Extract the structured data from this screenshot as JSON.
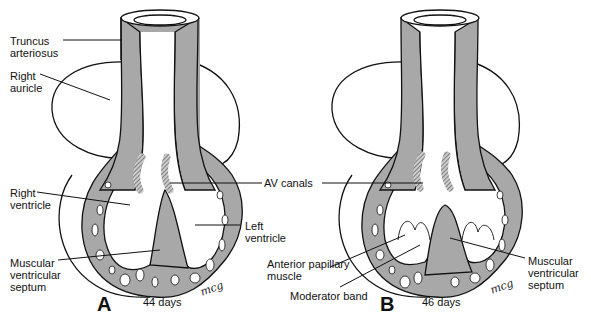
{
  "figure": {
    "panels": [
      {
        "letter": "A",
        "age": "44 days",
        "signature": "mcg",
        "labels": {
          "truncus": "Truncus\narteriosus",
          "right_auricle": "Right\nauricle",
          "right_ventricle": "Right\nventricle",
          "left_ventricle": "Left\nventricle",
          "muscular_septum": "Muscular\nventricular\nseptum"
        }
      },
      {
        "letter": "B",
        "age": "46 days",
        "signature": "mcg",
        "labels": {
          "anterior_papillary": "Anterior papillary\nmuscle",
          "moderator_band": "Moderator band",
          "muscular_septum": "Muscular\nventricular\nseptum"
        }
      }
    ],
    "shared_labels": {
      "av_canals": "AV canals"
    },
    "colors": {
      "myocardium_gray": "#a8a8a8",
      "outline": "#111111",
      "background": "#ffffff"
    }
  }
}
